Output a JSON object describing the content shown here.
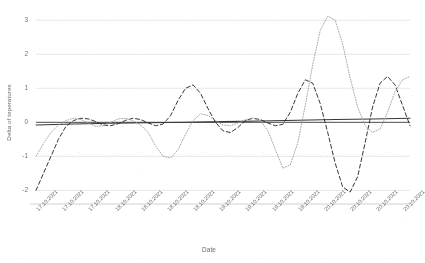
{
  "chart_data": {
    "type": "line",
    "title": "",
    "xlabel": "Date",
    "ylabel": "Delta of teperatures",
    "ylim": [
      -2.4,
      3.3
    ],
    "yticks": [
      3,
      2,
      1,
      0,
      -1,
      -2
    ],
    "ytick_labels": [
      "3",
      "2",
      "1",
      "0",
      "-1",
      "-2"
    ],
    "grid": true,
    "legend": "none",
    "categories": [
      "17.10.2021",
      "17.10.2021",
      "17.10.2021",
      "18.10.2021",
      "18.10.2021",
      "18.10.2021",
      "18.10.2021",
      "19.10.2021",
      "19.10.2021",
      "19.10.2021",
      "19.10.2021",
      "20.10.2021",
      "20.10.2021",
      "20.10.2021",
      "20.10.2021"
    ],
    "x_tick_positions": [
      0,
      7,
      14,
      21,
      28,
      35,
      42,
      49,
      56,
      63,
      70,
      77,
      84,
      91,
      98
    ],
    "series": [
      {
        "name": "solid-flat",
        "style": "solid",
        "color": "#3a3a3a",
        "x": [
          0,
          10,
          20,
          30,
          40,
          50,
          60,
          70,
          80,
          90,
          100
        ],
        "values": [
          -0.08,
          -0.05,
          -0.03,
          -0.01,
          0.0,
          0.02,
          0.04,
          0.06,
          0.08,
          0.1,
          0.12
        ]
      },
      {
        "name": "dashed-oscillation",
        "style": "dashed",
        "color": "#2f2f2f",
        "x": [
          0,
          2,
          4,
          6,
          8,
          10,
          12,
          14,
          16,
          18,
          20,
          22,
          24,
          26,
          28,
          30,
          32,
          34,
          36,
          38,
          40,
          42,
          44,
          46,
          48,
          50,
          52,
          54,
          56,
          58,
          60,
          62,
          64,
          66,
          68,
          70,
          72,
          74,
          76,
          78,
          80,
          82,
          84,
          86,
          88,
          90,
          92,
          94,
          96,
          98,
          100
        ],
        "values": [
          -2.0,
          -1.5,
          -1.0,
          -0.5,
          -0.12,
          0.05,
          0.12,
          0.1,
          0.02,
          -0.08,
          -0.1,
          -0.04,
          0.06,
          0.12,
          0.08,
          -0.02,
          -0.1,
          -0.05,
          0.2,
          0.65,
          1.0,
          1.1,
          0.85,
          0.4,
          0.0,
          -0.25,
          -0.3,
          -0.15,
          0.05,
          0.12,
          0.08,
          -0.02,
          -0.1,
          -0.06,
          0.3,
          0.85,
          1.25,
          1.15,
          0.55,
          -0.3,
          -1.2,
          -1.9,
          -2.05,
          -1.6,
          -0.6,
          0.45,
          1.15,
          1.35,
          1.1,
          0.5,
          -0.1
        ]
      },
      {
        "name": "dotted-oscillation",
        "style": "dotted",
        "color": "#9a9a9a",
        "x": [
          0,
          2,
          4,
          6,
          8,
          10,
          12,
          14,
          16,
          18,
          20,
          22,
          24,
          26,
          28,
          30,
          32,
          34,
          36,
          38,
          40,
          42,
          44,
          46,
          48,
          50,
          52,
          54,
          56,
          58,
          60,
          62,
          64,
          66,
          68,
          70,
          72,
          74,
          76,
          78,
          80,
          82,
          84,
          86,
          88,
          90,
          92,
          94,
          96,
          98,
          100
        ],
        "values": [
          -1.0,
          -0.62,
          -0.3,
          -0.08,
          0.05,
          0.12,
          0.08,
          -0.02,
          -0.12,
          -0.1,
          0.0,
          0.1,
          0.12,
          0.04,
          -0.08,
          -0.3,
          -0.7,
          -1.0,
          -1.05,
          -0.8,
          -0.35,
          0.05,
          0.25,
          0.2,
          0.05,
          -0.08,
          -0.1,
          -0.02,
          0.08,
          0.12,
          0.05,
          -0.25,
          -0.8,
          -1.35,
          -1.25,
          -0.6,
          0.5,
          1.7,
          2.7,
          3.12,
          3.0,
          2.3,
          1.3,
          0.45,
          -0.1,
          -0.3,
          -0.2,
          0.3,
          0.9,
          1.25,
          1.35
        ]
      }
    ]
  },
  "plot": {
    "left": 36,
    "right": 410,
    "top": 10,
    "bottom": 204
  }
}
